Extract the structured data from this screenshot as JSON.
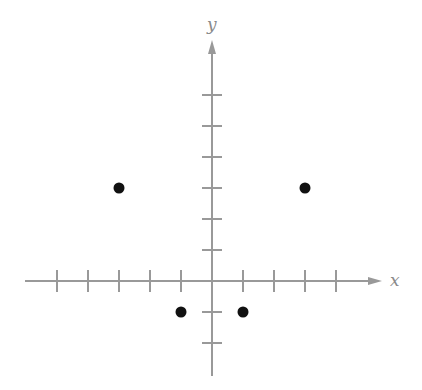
{
  "chart_data": {
    "type": "scatter",
    "title": "",
    "xlabel": "x",
    "ylabel": "y",
    "xlim": [
      -6,
      6
    ],
    "ylim": [
      -3,
      7
    ],
    "x_ticks": [
      -5,
      -4,
      -3,
      -2,
      -1,
      1,
      2,
      3,
      4
    ],
    "y_ticks": [
      -2,
      -1,
      1,
      2,
      3,
      4,
      5,
      6
    ],
    "grid": false,
    "tick_labels_shown": false,
    "points": [
      {
        "x": -3,
        "y": 3
      },
      {
        "x": 3,
        "y": 3
      },
      {
        "x": -1,
        "y": -1
      },
      {
        "x": 1,
        "y": -1
      }
    ]
  },
  "layout": {
    "origin_px": [
      212,
      281
    ],
    "unit_px": 31,
    "x_axis_px": [
      25,
      382
    ],
    "y_axis_px": [
      40,
      376
    ]
  },
  "colors": {
    "axis": "#999999",
    "point": "#111111",
    "label": "#8a8a8a"
  }
}
